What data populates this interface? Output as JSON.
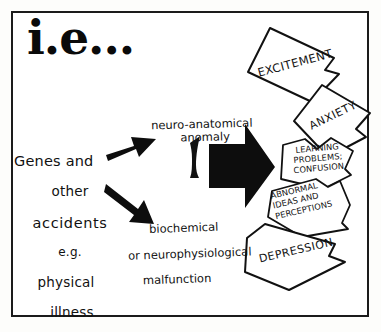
{
  "figure": {
    "title": "i.e...",
    "frame_color": "#1b1b1b",
    "ink_color": "#111111",
    "background_color": "#ffffff"
  },
  "cause": {
    "line1": "Genes and",
    "line2": "other",
    "line3": "accidents",
    "line4": "e.g.",
    "line5": "physical",
    "line6": "illness"
  },
  "mechanisms": {
    "upper": {
      "line1": "neuro-anatomical",
      "line2": "anomaly"
    },
    "lower": {
      "line1": "biochemical",
      "line2": "or neurophysiological",
      "line3": "malfunction"
    }
  },
  "arrows": {
    "to_upper": "arrow-up-right",
    "to_lower": "arrow-down-right",
    "to_outcomes": "big-right-arrow",
    "connector": "squiggle-mark"
  },
  "outcomes": [
    {
      "id": "excitement",
      "label": "EXCITEMENT"
    },
    {
      "id": "anxiety",
      "label": "ANXIETY"
    },
    {
      "id": "learning",
      "line1": "LEARNING",
      "line2": "PROBLEMS;",
      "line3": "CONFUSION"
    },
    {
      "id": "abnormal",
      "line1": "ABNORMAL",
      "line2": "IDEAS AND",
      "line3": "PERCEPTIONS"
    },
    {
      "id": "depression",
      "label": "DEPRESSION"
    }
  ]
}
